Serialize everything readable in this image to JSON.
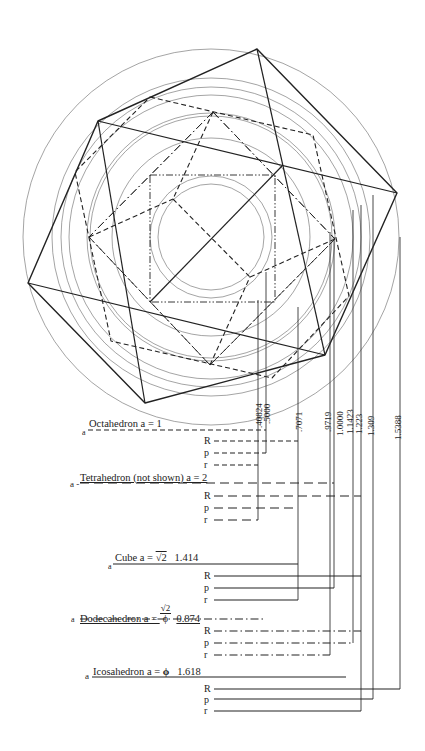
{
  "figure": {
    "center": [
      211,
      237
    ],
    "circles": [
      {
        "r": 188,
        "w": 0.6
      },
      {
        "r": 159,
        "w": 0.6
      },
      {
        "r": 150,
        "w": 0.6
      },
      {
        "r": 142,
        "w": 0.6
      },
      {
        "r": 124,
        "w": 0.6
      },
      {
        "r": 121,
        "w": 0.6
      },
      {
        "r": 99,
        "w": 0.6
      },
      {
        "r": 61,
        "w": 0.6
      },
      {
        "r": 53,
        "w": 0.6
      }
    ],
    "shapes": [
      {
        "name": "icosahedron-outline",
        "style": "solid",
        "width": 1.4,
        "points": [
          [
            257,
            49
          ],
          [
            397,
            193
          ],
          [
            325,
            355
          ],
          [
            145,
            403
          ],
          [
            28,
            283
          ],
          [
            98,
            121
          ]
        ]
      },
      {
        "name": "icosahedron-inner-edges",
        "style": "solid",
        "width": 1.2,
        "segments": [
          [
            [
              257,
              49
            ],
            [
              325,
              355
            ]
          ],
          [
            [
              98,
              121
            ],
            [
              397,
              193
            ]
          ],
          [
            [
              28,
              283
            ],
            [
              325,
              355
            ]
          ],
          [
            [
              98,
              121
            ],
            [
              145,
              403
            ]
          ],
          [
            [
              282,
              166
            ],
            [
              150,
              302
            ]
          ]
        ]
      },
      {
        "name": "dodecahedron-outline",
        "style": "dash",
        "width": 1.1,
        "points": [
          [
            150,
            97
          ],
          [
            313,
            135
          ],
          [
            349,
            296
          ],
          [
            272,
            378
          ],
          [
            111,
            341
          ],
          [
            75,
            172
          ]
        ]
      },
      {
        "name": "cube-outline",
        "style": "dashdot",
        "width": 0.9,
        "points": [
          [
            213,
            112
          ],
          [
            335,
            239
          ],
          [
            210,
            365
          ],
          [
            89,
            237
          ]
        ]
      },
      {
        "name": "cube-inner",
        "style": "dashdot",
        "width": 0.9,
        "segments": [
          [
            [
              213,
              112
            ],
            [
              89,
              237
            ]
          ],
          [
            [
              335,
              239
            ],
            [
              210,
              365
            ]
          ],
          [
            [
              89,
              237
            ],
            [
              210,
              365
            ]
          ],
          [
            [
              213,
              112
            ],
            [
              335,
              239
            ]
          ]
        ]
      },
      {
        "name": "tetra-square",
        "style": "dashdotdot",
        "width": 0.9,
        "points": [
          [
            150,
            175
          ],
          [
            275,
            175
          ],
          [
            275,
            302
          ],
          [
            150,
            302
          ]
        ]
      },
      {
        "name": "octahedron-edges",
        "style": "dash",
        "width": 1.1,
        "segments": [
          [
            [
              173,
              199
            ],
            [
              250,
              277
            ]
          ],
          [
            [
              89,
              237
            ],
            [
              173,
              199
            ]
          ],
          [
            [
              335,
              239
            ],
            [
              250,
              277
            ]
          ],
          [
            [
              213,
              112
            ],
            [
              173,
              199
            ]
          ],
          [
            [
              210,
              365
            ],
            [
              250,
              277
            ]
          ]
        ]
      }
    ]
  },
  "columns": [
    {
      "label": ".40824",
      "x": 258,
      "top": 300
    },
    {
      "label": ".5000",
      "x": 266,
      "top": 272
    },
    {
      "label": ".7071",
      "x": 298,
      "top": 307
    },
    {
      "label": ".9719",
      "x": 330,
      "top": 232
    },
    {
      "label": "1.0000",
      "x": 334,
      "top": 237
    },
    {
      "label": "1.1423",
      "x": 353,
      "top": 210
    },
    {
      "label": "1.223",
      "x": 361,
      "top": 205
    },
    {
      "label": "1.309",
      "x": 373,
      "top": 195
    },
    {
      "label": "1.5388",
      "x": 400,
      "top": 237
    }
  ],
  "solids": [
    {
      "name": "octahedron",
      "a_prefix": "a",
      "title": "Octahedron a = 1",
      "style": "dash",
      "title_y": 430,
      "a_line_end": 266,
      "rows": [
        {
          "label": "R",
          "y": 441,
          "end": 298
        },
        {
          "label": "p",
          "y": 453,
          "end": 266
        },
        {
          "label": "r",
          "y": 465,
          "end": 258
        }
      ]
    },
    {
      "name": "tetrahedron",
      "a_prefix": "a -",
      "title": "Tetrahedron (not shown) a = 2",
      "style": "longdash",
      "title_y": 483,
      "a_line_end": 334,
      "rows": [
        {
          "label": "R",
          "y": 496,
          "end": 361
        },
        {
          "label": "p",
          "y": 508,
          "end": 298
        },
        {
          "label": "r",
          "y": 520,
          "end": 258
        }
      ]
    },
    {
      "name": "cube",
      "a_prefix": "a",
      "title": "Cube a = ",
      "title_sqrt": "√2",
      "title_value": "1.414",
      "style": "solid",
      "title_y": 564,
      "a_line_end": 298,
      "rows": [
        {
          "label": "R",
          "y": 576,
          "end": 361
        },
        {
          "label": "p",
          "y": 588,
          "end": 334
        },
        {
          "label": "r",
          "y": 600,
          "end": 298
        }
      ]
    },
    {
      "name": "dodecahedron",
      "a_prefix": "a",
      "title": "Dodecahedron a = ",
      "frac_num": "√2",
      "frac_den": "ϕ",
      "title_value": "0.874",
      "style": "dashdot",
      "title_y": 619,
      "a_line_end": 265,
      "rows": [
        {
          "label": "R",
          "y": 631,
          "end": 361
        },
        {
          "label": "p",
          "y": 643,
          "end": 353
        },
        {
          "label": "r",
          "y": 655,
          "end": 330
        }
      ]
    },
    {
      "name": "icosahedron",
      "a_prefix": "a",
      "title": "Icosahedron a = ",
      "phi": "ϕ",
      "title_value": "1.618",
      "style": "solid",
      "title_y": 677,
      "a_line_end": 346,
      "rows": [
        {
          "label": "R",
          "y": 689,
          "end": 400
        },
        {
          "label": "p",
          "y": 699,
          "end": 373
        },
        {
          "label": "r",
          "y": 711,
          "end": 361
        }
      ]
    }
  ]
}
